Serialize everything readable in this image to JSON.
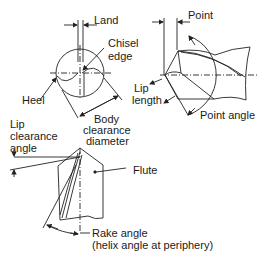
{
  "diagram": {
    "views": {
      "end_view": {
        "labels": {
          "land": "Land",
          "chisel_edge_1": "Chisel",
          "chisel_edge_2": "edge",
          "heel": "Heel",
          "body_clearance_1": "Body",
          "body_clearance_2": "clearance",
          "body_clearance_3": "diameter"
        }
      },
      "side_view": {
        "labels": {
          "point": "Point",
          "lip_length_1": "Lip",
          "lip_length_2": "length",
          "point_angle": "Point angle"
        }
      },
      "flute_view": {
        "labels": {
          "lip_clearance_1": "Lip",
          "lip_clearance_2": "clearance",
          "lip_clearance_3": "angle",
          "flute": "Flute",
          "rake_angle_1": "Rake angle",
          "rake_angle_2": "(helix angle at periphery)"
        }
      }
    }
  }
}
